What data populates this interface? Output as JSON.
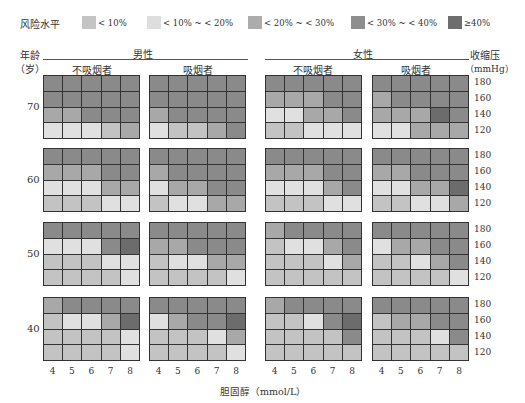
{
  "legend": {
    "title": "风险水平",
    "items": [
      {
        "label": "< 10%",
        "color": "#c4c4c4"
      },
      {
        "label": "< 10% ~ < 20%",
        "color": "#dedede"
      },
      {
        "label": "< 20% ~ < 30%",
        "color": "#acacac"
      },
      {
        "label": "< 30% ~ < 40%",
        "color": "#8e8e8e"
      },
      {
        "label": "≥40%",
        "color": "#6e6e6e"
      }
    ]
  },
  "level_colors": [
    "#e0e0e0",
    "#c3c3c3",
    "#a8a8a8",
    "#8a8a8a",
    "#6c6c6c"
  ],
  "headers": {
    "age_label": "年龄",
    "age_unit": "（岁）",
    "male": "男性",
    "female": "女性",
    "non_smoker": "不吸烟者",
    "smoker": "吸烟者",
    "bp_label": "收缩压",
    "bp_unit": "（mmHg）",
    "xlabel": "胆固醇（mmol/L）"
  },
  "ages": [
    "70",
    "60",
    "50",
    "40"
  ],
  "bp_ticks": [
    "180",
    "160",
    "140",
    "120"
  ],
  "chol_ticks": [
    "4",
    "5",
    "6",
    "7",
    "8"
  ],
  "chart_data": {
    "type": "heatmap",
    "title": "风险水平",
    "xlabel": "胆固醇（mmol/L）",
    "ylabel": "收缩压（mmHg）",
    "x": [
      4,
      5,
      6,
      7,
      8
    ],
    "y": [
      180,
      160,
      140,
      120
    ],
    "level_legend": [
      "< 10%",
      "< 10% ~ < 20%",
      "< 20% ~ < 30%",
      "< 30% ~ < 40%",
      "≥40%"
    ],
    "note": "levels 1 (lightest) to 5 (darkest); rows top to bottom = SBP 180,160,140,120",
    "panels": {
      "70": {
        "male_nonsmoker": [
          [
            4,
            4,
            4,
            4,
            4
          ],
          [
            4,
            4,
            4,
            4,
            4
          ],
          [
            3,
            3,
            4,
            4,
            4
          ],
          [
            1,
            1,
            1,
            2,
            3
          ]
        ],
        "male_smoker": [
          [
            4,
            4,
            4,
            4,
            4
          ],
          [
            4,
            4,
            4,
            4,
            4
          ],
          [
            3,
            4,
            4,
            4,
            4
          ],
          [
            1,
            2,
            2,
            3,
            4
          ]
        ],
        "female_nonsmoker": [
          [
            4,
            4,
            4,
            4,
            4
          ],
          [
            3,
            3,
            3,
            4,
            4
          ],
          [
            1,
            1,
            3,
            3,
            4
          ],
          [
            2,
            2,
            1,
            1,
            1
          ]
        ],
        "female_smoker": [
          [
            4,
            4,
            4,
            4,
            4
          ],
          [
            3,
            4,
            4,
            4,
            4
          ],
          [
            3,
            3,
            3,
            5,
            4
          ],
          [
            1,
            1,
            3,
            3,
            3
          ]
        ]
      },
      "60": {
        "male_nonsmoker": [
          [
            4,
            4,
            4,
            4,
            4
          ],
          [
            3,
            3,
            3,
            4,
            4
          ],
          [
            1,
            1,
            1,
            3,
            3
          ],
          [
            2,
            2,
            2,
            1,
            1
          ]
        ],
        "male_smoker": [
          [
            4,
            4,
            4,
            4,
            4
          ],
          [
            3,
            4,
            4,
            4,
            4
          ],
          [
            1,
            3,
            3,
            4,
            4
          ],
          [
            2,
            1,
            1,
            3,
            3
          ]
        ],
        "female_nonsmoker": [
          [
            4,
            4,
            4,
            4,
            4
          ],
          [
            3,
            3,
            3,
            4,
            4
          ],
          [
            1,
            1,
            1,
            3,
            4
          ],
          [
            2,
            2,
            2,
            1,
            1
          ]
        ],
        "female_smoker": [
          [
            4,
            4,
            4,
            4,
            4
          ],
          [
            3,
            3,
            4,
            4,
            4
          ],
          [
            1,
            1,
            3,
            3,
            5
          ],
          [
            2,
            2,
            1,
            1,
            3
          ]
        ]
      },
      "50": {
        "male_nonsmoker": [
          [
            4,
            4,
            4,
            4,
            4
          ],
          [
            1,
            1,
            1,
            4,
            5
          ],
          [
            2,
            2,
            2,
            1,
            1
          ],
          [
            2,
            2,
            2,
            2,
            1
          ]
        ],
        "male_smoker": [
          [
            4,
            4,
            4,
            4,
            4
          ],
          [
            3,
            3,
            4,
            4,
            4
          ],
          [
            2,
            1,
            1,
            3,
            3
          ],
          [
            2,
            2,
            2,
            2,
            1
          ]
        ],
        "female_nonsmoker": [
          [
            3,
            4,
            4,
            4,
            4
          ],
          [
            2,
            1,
            1,
            3,
            4
          ],
          [
            2,
            2,
            2,
            1,
            3
          ],
          [
            2,
            2,
            2,
            2,
            2
          ]
        ],
        "female_smoker": [
          [
            4,
            4,
            4,
            4,
            4
          ],
          [
            1,
            3,
            3,
            4,
            4
          ],
          [
            2,
            2,
            1,
            3,
            4
          ],
          [
            2,
            2,
            2,
            2,
            1
          ]
        ]
      },
      "40": {
        "male_nonsmoker": [
          [
            3,
            4,
            4,
            4,
            4
          ],
          [
            2,
            1,
            1,
            3,
            5
          ],
          [
            2,
            2,
            2,
            2,
            1
          ],
          [
            2,
            2,
            2,
            2,
            1
          ]
        ],
        "male_smoker": [
          [
            4,
            4,
            4,
            4,
            4
          ],
          [
            1,
            3,
            4,
            4,
            5
          ],
          [
            2,
            2,
            2,
            1,
            3
          ],
          [
            2,
            2,
            2,
            2,
            1
          ]
        ],
        "female_nonsmoker": [
          [
            3,
            4,
            4,
            4,
            4
          ],
          [
            2,
            2,
            1,
            4,
            5
          ],
          [
            2,
            2,
            2,
            2,
            4
          ],
          [
            2,
            2,
            2,
            2,
            2
          ]
        ],
        "female_smoker": [
          [
            4,
            4,
            4,
            4,
            4
          ],
          [
            2,
            3,
            3,
            4,
            4
          ],
          [
            2,
            2,
            2,
            1,
            4
          ],
          [
            2,
            2,
            2,
            2,
            2
          ]
        ]
      }
    }
  }
}
